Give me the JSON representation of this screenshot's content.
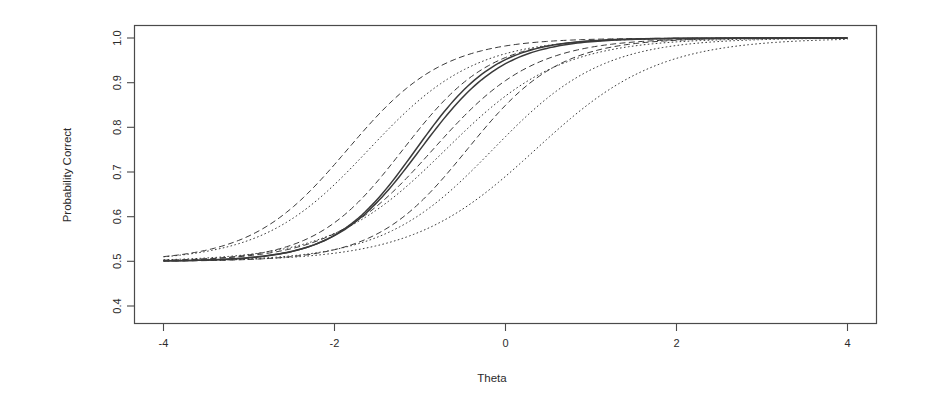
{
  "figure": {
    "title": "",
    "background": "#ffffff",
    "line_color": "#3a3a3a"
  },
  "axes": {
    "x_title": "Theta",
    "y_title": "Probability Correct",
    "x_ticks": [
      "-4",
      "-2",
      "0",
      "2",
      "4"
    ],
    "y_ticks": [
      "0.4",
      "0.5",
      "0.6",
      "0.7",
      "0.8",
      "0.9",
      "1.0"
    ]
  },
  "chart_data": {
    "type": "line",
    "title": "",
    "xlabel": "Theta",
    "ylabel": "Probability Correct",
    "xlim": [
      -4.6,
      4.6
    ],
    "ylim": [
      0.37,
      1.02
    ],
    "xticks": [
      -4,
      -2,
      0,
      2,
      4
    ],
    "yticks": [
      0.4,
      0.5,
      0.6,
      0.7,
      0.8,
      0.9,
      1.0
    ],
    "grid": false,
    "legend": "none",
    "x": [
      -4,
      -3.5,
      -3,
      -2.5,
      -2,
      -1.5,
      -1,
      -0.5,
      0,
      0.5,
      1,
      1.5,
      2,
      2.5,
      3,
      3.5,
      4
    ],
    "series": [
      {
        "name": "item-1",
        "linestyle": "dashed",
        "model": "3PL",
        "a": 1.05,
        "b": -1.85,
        "c": 0.5,
        "values": [
          0.513,
          0.522,
          0.537,
          0.561,
          0.598,
          0.648,
          0.709,
          0.774,
          0.833,
          0.882,
          0.918,
          0.943,
          0.961,
          0.973,
          0.982,
          0.987,
          0.991
        ]
      },
      {
        "name": "item-2",
        "linestyle": "dotted",
        "model": "3PL",
        "a": 0.95,
        "b": -1.6,
        "c": 0.5,
        "values": [
          0.511,
          0.518,
          0.53,
          0.548,
          0.577,
          0.619,
          0.674,
          0.736,
          0.797,
          0.85,
          0.892,
          0.923,
          0.945,
          0.961,
          0.972,
          0.98,
          0.986
        ]
      },
      {
        "name": "item-3",
        "linestyle": "dashed",
        "model": "3PL",
        "a": 1.15,
        "b": -1.2,
        "c": 0.5,
        "values": [
          0.506,
          0.51,
          0.518,
          0.531,
          0.553,
          0.587,
          0.637,
          0.7,
          0.77,
          0.834,
          0.885,
          0.921,
          0.946,
          0.963,
          0.975,
          0.983,
          0.988
        ]
      },
      {
        "name": "item-4",
        "linestyle": "solid",
        "model": "3PL",
        "a": 1.25,
        "b": -1.05,
        "c": 0.5,
        "values": [
          0.505,
          0.508,
          0.514,
          0.525,
          0.544,
          0.575,
          0.624,
          0.69,
          0.766,
          0.836,
          0.89,
          0.928,
          0.953,
          0.969,
          0.98,
          0.987,
          0.991
        ]
      },
      {
        "name": "item-5",
        "linestyle": "solid",
        "model": "3PL",
        "a": 1.2,
        "b": -1.0,
        "c": 0.5,
        "values": [
          0.505,
          0.509,
          0.516,
          0.528,
          0.548,
          0.579,
          0.626,
          0.69,
          0.762,
          0.83,
          0.884,
          0.922,
          0.948,
          0.966,
          0.977,
          0.985,
          0.99
        ]
      },
      {
        "name": "item-6",
        "linestyle": "dashed",
        "model": "3PL",
        "a": 1.0,
        "b": -0.85,
        "c": 0.5,
        "values": [
          0.508,
          0.513,
          0.522,
          0.535,
          0.555,
          0.584,
          0.623,
          0.673,
          0.73,
          0.788,
          0.84,
          0.882,
          0.914,
          0.938,
          0.955,
          0.968,
          0.977
        ]
      },
      {
        "name": "item-7",
        "linestyle": "dotted",
        "model": "3PL",
        "a": 0.88,
        "b": -0.7,
        "c": 0.5,
        "values": [
          0.51,
          0.515,
          0.523,
          0.535,
          0.553,
          0.578,
          0.613,
          0.657,
          0.708,
          0.763,
          0.815,
          0.86,
          0.897,
          0.925,
          0.946,
          0.961,
          0.972
        ]
      },
      {
        "name": "item-8",
        "linestyle": "dashed",
        "model": "3PL",
        "a": 1.1,
        "b": -0.45,
        "c": 0.5,
        "values": [
          0.504,
          0.507,
          0.512,
          0.52,
          0.533,
          0.553,
          0.583,
          0.626,
          0.683,
          0.75,
          0.815,
          0.87,
          0.911,
          0.94,
          0.96,
          0.973,
          0.982
        ]
      },
      {
        "name": "item-9",
        "linestyle": "dotted",
        "model": "3PL",
        "a": 0.92,
        "b": -0.15,
        "c": 0.5,
        "values": [
          0.505,
          0.508,
          0.512,
          0.519,
          0.529,
          0.545,
          0.568,
          0.601,
          0.646,
          0.701,
          0.762,
          0.82,
          0.87,
          0.908,
          0.937,
          0.957,
          0.971
        ]
      },
      {
        "name": "item-10",
        "linestyle": "dotted",
        "model": "3PL",
        "a": 0.82,
        "b": 0.35,
        "c": 0.5,
        "values": [
          0.507,
          0.51,
          0.515,
          0.522,
          0.533,
          0.548,
          0.569,
          0.598,
          0.635,
          0.681,
          0.733,
          0.787,
          0.836,
          0.878,
          0.911,
          0.936,
          0.955
        ]
      }
    ]
  }
}
